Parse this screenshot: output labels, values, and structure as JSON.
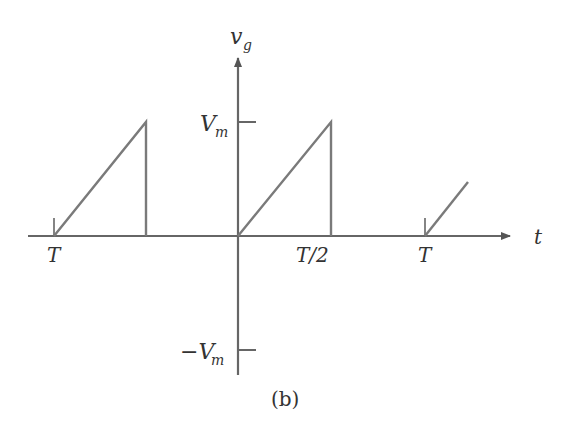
{
  "figure": {
    "caption": "(b)",
    "y_axis_label": "v",
    "y_axis_subscript": "g",
    "x_axis_label": "t",
    "tick_labels": {
      "vm": "V",
      "vm_sub": "m",
      "neg_vm_prefix": "−V",
      "neg_vm_sub": "m",
      "left_t": "T",
      "half_t": "T/2",
      "right_t": "T"
    }
  },
  "colors": {
    "axis": "#555555",
    "waveform": "#777777",
    "text": "#333333"
  },
  "waveform": {
    "type": "sawtooth",
    "segments": [
      {
        "from": "T (left)",
        "to": "peak Vm",
        "then": "drop to 0"
      },
      {
        "from": "0",
        "to": "peak Vm at T/2",
        "then": "drop to 0"
      },
      {
        "from": "T (right)",
        "rising": true
      }
    ]
  }
}
